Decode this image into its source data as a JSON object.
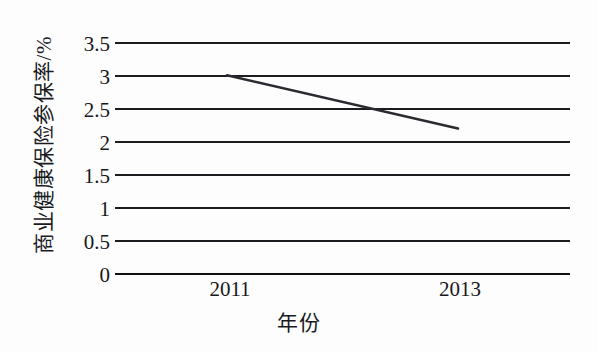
{
  "chart_data": {
    "type": "line",
    "title": "",
    "xlabel": "年份",
    "ylabel": "商业健康保险参保率/%",
    "x": [
      "2011",
      "2013"
    ],
    "categories": [
      "2011",
      "2013"
    ],
    "values": [
      3.0,
      2.2
    ],
    "series": [
      {
        "name": "商业健康保险参保率",
        "values": [
          3.0,
          2.2
        ]
      }
    ],
    "ylim": [
      0,
      3.5
    ],
    "ytick_labels": [
      "0",
      "0.5",
      "1",
      "1.5",
      "2",
      "2.5",
      "3",
      "3.5"
    ],
    "ytick_values": [
      0,
      0.5,
      1,
      1.5,
      2,
      2.5,
      3,
      3.5
    ],
    "xtick_labels": [
      "2011",
      "2013"
    ],
    "grid": "horizontal",
    "legend": "none",
    "line_color": "#2a2a30"
  },
  "axes": {
    "y_title": "商业健康保险参保率/%",
    "x_title": "年份"
  }
}
